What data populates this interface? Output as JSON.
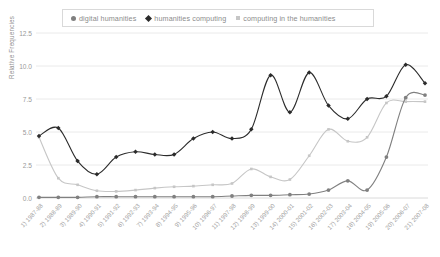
{
  "legend": {
    "position": "top",
    "border_color": "#d9d9d9",
    "entries": [
      {
        "label": "digital humanities",
        "marker": "circle-icon",
        "color": "#808080"
      },
      {
        "label": "humanities computing",
        "marker": "diamond-icon",
        "color": "#2b2b2b"
      },
      {
        "label": "computing in the humanities",
        "marker": "square-icon",
        "color": "#c6c6c6"
      }
    ]
  },
  "chart_data": {
    "type": "line",
    "title": "",
    "xlabel": "",
    "ylabel": "Relative Frequencies",
    "ylim": [
      0,
      12.5
    ],
    "yticks": [
      "0.0",
      "2.5",
      "5.0",
      "7.5",
      "10.0",
      "12.5"
    ],
    "ytick_values": [
      0,
      2.5,
      5,
      7.5,
      10,
      12.5
    ],
    "grid": true,
    "grid_color": "#e4e4e4",
    "legend_position": "top",
    "categories": [
      "1) 1987-88",
      "2) 1988-89",
      "3) 1989-90",
      "4) 1990-91",
      "5) 1991-92",
      "6) 1992-93",
      "7) 1993-94",
      "8) 1994-95",
      "9) 1995-96",
      "10) 1996-97",
      "11) 1997-98",
      "12) 1998-99",
      "13) 1999-00",
      "14) 2000-01",
      "15) 2001-02",
      "16) 2002-03",
      "17) 2003-04",
      "18) 2004-05",
      "19) 2005-06",
      "20) 2006-07",
      "21) 2007-08"
    ],
    "series": [
      {
        "name": "humanities computing",
        "color": "#2b2b2b",
        "marker": "diamond",
        "values": [
          4.7,
          5.3,
          2.8,
          1.8,
          3.1,
          3.5,
          3.3,
          3.3,
          4.5,
          5.0,
          4.5,
          5.2,
          9.3,
          6.5,
          9.5,
          7.0,
          6.0,
          7.5,
          7.7,
          10.1,
          8.7
        ]
      },
      {
        "name": "computing in the humanities",
        "color": "#c6c6c6",
        "marker": "square",
        "values": [
          4.6,
          1.5,
          1.0,
          0.55,
          0.5,
          0.6,
          0.75,
          0.85,
          0.9,
          1.0,
          1.1,
          2.2,
          1.6,
          1.4,
          3.2,
          5.2,
          4.3,
          4.6,
          7.2,
          7.3,
          7.3
        ]
      },
      {
        "name": "digital humanities",
        "color": "#808080",
        "marker": "circle",
        "values": [
          0.05,
          0.05,
          0.05,
          0.1,
          0.1,
          0.1,
          0.1,
          0.1,
          0.1,
          0.1,
          0.15,
          0.2,
          0.2,
          0.25,
          0.3,
          0.6,
          1.3,
          0.6,
          3.1,
          7.6,
          7.8
        ]
      }
    ]
  }
}
